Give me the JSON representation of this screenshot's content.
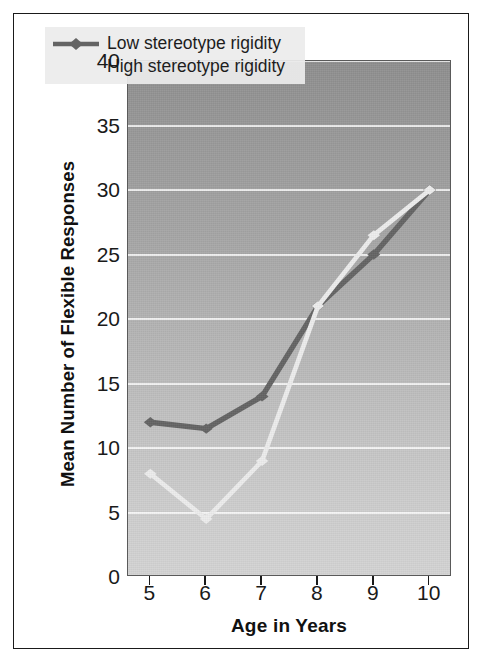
{
  "figure": {
    "background_color": "#ffffff",
    "border_color": "#1a1a1a"
  },
  "chart_data": {
    "type": "line",
    "title": "",
    "xlabel": "Age in Years",
    "ylabel": "Mean Number of Flexible Responses",
    "x": [
      5,
      6,
      7,
      8,
      9,
      10
    ],
    "categories": [
      "5",
      "6",
      "7",
      "8",
      "9",
      "10"
    ],
    "xlim": [
      4.6,
      10.4
    ],
    "ylim": [
      0,
      40
    ],
    "yticks": [
      0,
      5,
      10,
      15,
      20,
      25,
      30,
      35,
      40
    ],
    "ytick_labels": [
      "0",
      "5",
      "10",
      "15",
      "20",
      "25",
      "30",
      "35",
      "40"
    ],
    "xtick_labels": [
      "5",
      "6",
      "7",
      "8",
      "9",
      "10"
    ],
    "grid": "horizontal",
    "gridline_color": "#ffffff",
    "plot_background": "gray vertical gradient, dark top to light bottom",
    "legend_position": "upper-left-inside",
    "series": [
      {
        "name": "Low stereotype rigidity",
        "color": "#646464",
        "marker": "diamond",
        "values": [
          12,
          11.5,
          14,
          21,
          25,
          30
        ]
      },
      {
        "name": "High stereotype rigidity",
        "color": "#ededed",
        "marker": "diamond",
        "values": [
          8,
          4.5,
          9,
          21,
          26.5,
          30
        ]
      }
    ]
  },
  "legend": {
    "items": [
      {
        "label": "Low stereotype rigidity",
        "color": "#646464"
      },
      {
        "label": "High stereotype rigidity",
        "color": "#ededed"
      }
    ]
  }
}
